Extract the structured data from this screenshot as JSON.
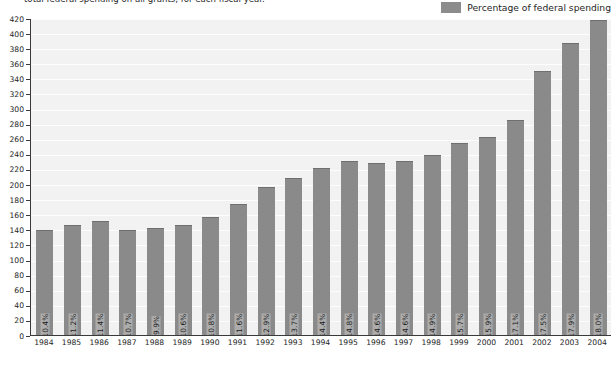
{
  "caption": {
    "clipped_line": "total federal spending on all grants, for each fiscal year."
  },
  "legend": {
    "swatch_color": "#8c8c8c",
    "label": "Percentage of federal spending"
  },
  "footnote": {
    "clipped_line": ""
  },
  "chart_data": {
    "type": "bar",
    "title": "",
    "subtitle": "total federal spending on all grants, for each fiscal year.",
    "xlabel": "",
    "ylabel": "",
    "ylim": [
      0,
      420
    ],
    "ytick_step": 20,
    "grid": true,
    "legend_position": "top-right",
    "bar_color": "#8a8a8a",
    "yticks": [
      0,
      20,
      40,
      60,
      80,
      100,
      120,
      140,
      160,
      180,
      200,
      220,
      240,
      260,
      280,
      300,
      320,
      340,
      360,
      380,
      400,
      420
    ],
    "categories": [
      "1984",
      "1985",
      "1986",
      "1987",
      "1988",
      "1989",
      "1990",
      "1991",
      "1992",
      "1993",
      "1994",
      "1995",
      "1996",
      "1997",
      "1998",
      "1999",
      "2000",
      "2001",
      "2002",
      "2003",
      "2004"
    ],
    "series": [
      {
        "name": "Percentage of federal spending",
        "values": [
          139,
          146,
          151,
          139,
          142,
          146,
          157,
          174,
          196,
          208,
          221,
          231,
          228,
          230,
          239,
          254,
          263,
          285,
          350,
          387,
          418
        ],
        "data_labels": [
          "10.4%",
          "11.2%",
          "11.4%",
          "10.7%",
          "9.9%",
          "10.6%",
          "10.8%",
          "11.6%",
          "12.9%",
          "13.7%",
          "14.4%",
          "14.8%",
          "14.6%",
          "14.6%",
          "14.9%",
          "15.7%",
          "15.9%",
          "17.1%",
          "17.5%",
          "17.9%",
          "18.0%"
        ]
      }
    ]
  }
}
